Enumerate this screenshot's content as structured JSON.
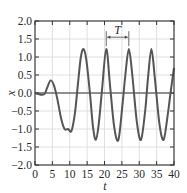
{
  "chart_data": {
    "type": "line",
    "title": "",
    "xlabel": "t",
    "ylabel": "x",
    "xlim": [
      0,
      40
    ],
    "ylim": [
      -2.0,
      2.0
    ],
    "xticks": [
      0,
      5,
      10,
      15,
      20,
      25,
      30,
      35,
      40
    ],
    "yticks": [
      -2.0,
      -1.5,
      -1.0,
      -0.5,
      0.0,
      0.5,
      1.0,
      1.5,
      2.0
    ],
    "xtick_labels": [
      "0",
      "5",
      "10",
      "15",
      "20",
      "25",
      "30",
      "35",
      "40"
    ],
    "ytick_labels": [
      "−2.0",
      "−1.5",
      "−1.0",
      "−0.5",
      "0.0",
      "0.5",
      "1.0",
      "1.5",
      "2.0"
    ],
    "grid": true,
    "zero_line": true,
    "annotations": [
      {
        "text": "T",
        "type": "period-bracket",
        "t_start": 20.5,
        "t_end": 27.0,
        "y": 1.55
      }
    ],
    "series": [
      {
        "name": "x(t)",
        "color": "#555555",
        "x": [
          0,
          1,
          2,
          2.8,
          3.5,
          4.5,
          5.5,
          6.5,
          7.5,
          8.5,
          9.5,
          10.5,
          11.5,
          12.3,
          13.2,
          14.0,
          14.8,
          15.8,
          16.7,
          17.5,
          18.3,
          19.3,
          20.5,
          21.6,
          22.8,
          24.0,
          25.2,
          26.0,
          27.0,
          28.0,
          29.3,
          30.5,
          31.7,
          32.5,
          33.5,
          34.5,
          35.8,
          37.0,
          38.2,
          39.0,
          40.0
        ],
        "values": [
          0.0,
          -0.03,
          -0.05,
          -0.02,
          0.15,
          0.35,
          0.2,
          -0.2,
          -0.7,
          -1.0,
          -1.0,
          -1.05,
          -0.55,
          0.2,
          1.0,
          1.22,
          0.9,
          0.0,
          -0.95,
          -1.3,
          -0.9,
          0.1,
          1.22,
          0.2,
          -0.95,
          -1.3,
          -0.3,
          0.5,
          1.22,
          0.5,
          -0.8,
          -1.3,
          -0.5,
          0.4,
          1.22,
          0.4,
          -0.85,
          -1.3,
          -0.6,
          0.0,
          0.7
        ]
      }
    ]
  },
  "axes": {
    "x_label": "t",
    "y_label": "x",
    "period_label": "T"
  }
}
